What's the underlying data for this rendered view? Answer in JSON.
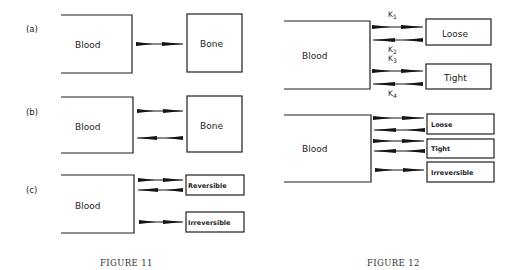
{
  "figures": [
    {
      "caption": "FIGURE 11",
      "panels": [
        {
          "label": "(a)",
          "source": "Blood",
          "targets": [
            "Bone"
          ],
          "flows": [
            {
              "from": "Blood",
              "to": "Bone",
              "direction": "forward"
            }
          ]
        },
        {
          "label": "(b)",
          "source": "Blood",
          "targets": [
            "Bone"
          ],
          "flows": [
            {
              "from": "Blood",
              "to": "Bone",
              "direction": "forward"
            },
            {
              "from": "Bone",
              "to": "Blood",
              "direction": "reverse"
            }
          ]
        },
        {
          "label": "(c)",
          "source": "Blood",
          "targets": [
            "Reversible",
            "Irreversible"
          ],
          "flows": [
            {
              "from": "Blood",
              "to": "Reversible",
              "direction": "forward"
            },
            {
              "from": "Reversible",
              "to": "Blood",
              "direction": "reverse"
            },
            {
              "from": "Blood",
              "to": "Irreversible",
              "direction": "forward"
            }
          ]
        }
      ]
    },
    {
      "caption": "FIGURE 12",
      "panels": [
        {
          "source": "Blood",
          "targets": [
            "Loose",
            "Tight"
          ],
          "rate_constants": [
            "K",
            "K",
            "K",
            "K"
          ],
          "rate_subscripts": [
            "1",
            "2",
            "3",
            "4"
          ],
          "flows": [
            {
              "from": "Blood",
              "to": "Loose",
              "rate": "K1"
            },
            {
              "from": "Loose",
              "to": "Blood",
              "rate": "K2"
            },
            {
              "from": "Blood",
              "to": "Tight",
              "rate": "K3"
            },
            {
              "from": "Tight",
              "to": "Blood",
              "rate": "K4"
            }
          ]
        },
        {
          "source": "Blood",
          "targets": [
            "Loose",
            "Tight",
            "Irreversible"
          ],
          "flows": [
            {
              "from": "Blood",
              "to": "Loose",
              "direction": "forward"
            },
            {
              "from": "Loose",
              "to": "Blood",
              "direction": "reverse"
            },
            {
              "from": "Blood",
              "to": "Tight",
              "direction": "forward"
            },
            {
              "from": "Tight",
              "to": "Blood",
              "direction": "reverse"
            },
            {
              "from": "Blood",
              "to": "Irreversible",
              "direction": "forward"
            }
          ]
        }
      ]
    }
  ],
  "colors": {
    "ink": "#1e1e1e",
    "background": "#ffffff"
  }
}
